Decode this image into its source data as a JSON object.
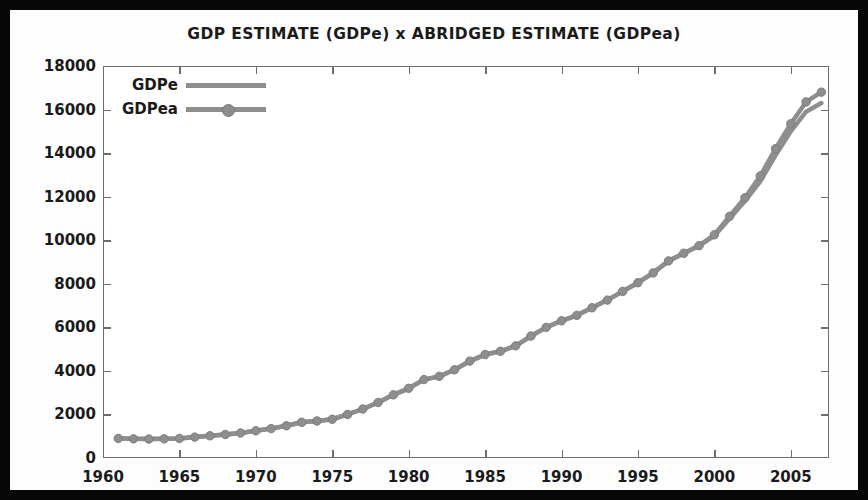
{
  "chart_data": {
    "type": "line",
    "title": "GDP ESTIMATE (GDPe)  x  ABRIDGED ESTIMATE (GDPea)",
    "xlabel": "",
    "ylabel": "",
    "xlim": [
      1960,
      2007.5
    ],
    "ylim": [
      0,
      18000
    ],
    "grid": false,
    "legend_position": "top-left",
    "xticks": [
      "1960",
      "1965",
      "1970",
      "1975",
      "1980",
      "1985",
      "1990",
      "1995",
      "2000",
      "2005"
    ],
    "xtick_values": [
      1960,
      1965,
      1970,
      1975,
      1980,
      1985,
      1990,
      1995,
      2000,
      2005
    ],
    "yticks": [
      "0",
      "2000",
      "4000",
      "6000",
      "8000",
      "10000",
      "12000",
      "14000",
      "16000",
      "18000"
    ],
    "ytick_values": [
      0,
      2000,
      4000,
      6000,
      8000,
      10000,
      12000,
      14000,
      16000,
      18000
    ],
    "x": [
      1961,
      1962,
      1963,
      1964,
      1965,
      1966,
      1967,
      1968,
      1969,
      1970,
      1971,
      1972,
      1973,
      1974,
      1975,
      1976,
      1977,
      1978,
      1979,
      1980,
      1981,
      1982,
      1983,
      1984,
      1985,
      1986,
      1987,
      1988,
      1989,
      1990,
      1991,
      1992,
      1993,
      1994,
      1995,
      1996,
      1997,
      1998,
      1999,
      2000,
      2001,
      2002,
      2003,
      2004,
      2005,
      2006,
      2007
    ],
    "series": [
      {
        "name": "GDPe",
        "marker": "none",
        "color": "#8e8e8e",
        "values": [
          900,
          880,
          870,
          880,
          900,
          960,
          1020,
          1080,
          1150,
          1250,
          1350,
          1480,
          1640,
          1700,
          1780,
          2000,
          2250,
          2550,
          2900,
          3200,
          3600,
          3750,
          4050,
          4450,
          4750,
          4900,
          5150,
          5600,
          6000,
          6300,
          6550,
          6900,
          7250,
          7650,
          8050,
          8500,
          9050,
          9400,
          9750,
          10200,
          11000,
          11800,
          12700,
          13900,
          15000,
          15900,
          16300
        ]
      },
      {
        "name": "GDPea",
        "marker": "circle",
        "color": "#8e8e8e",
        "values": [
          900,
          880,
          870,
          880,
          900,
          960,
          1020,
          1080,
          1150,
          1250,
          1350,
          1480,
          1640,
          1700,
          1780,
          2000,
          2250,
          2550,
          2900,
          3200,
          3600,
          3750,
          4050,
          4450,
          4750,
          4900,
          5150,
          5600,
          6000,
          6300,
          6550,
          6900,
          7250,
          7650,
          8050,
          8500,
          9050,
          9400,
          9750,
          10250,
          11100,
          11950,
          12950,
          14200,
          15350,
          16350,
          16800
        ]
      }
    ]
  },
  "legend": {
    "entries": [
      {
        "label": "GDPe"
      },
      {
        "label": "GDPea"
      }
    ]
  }
}
